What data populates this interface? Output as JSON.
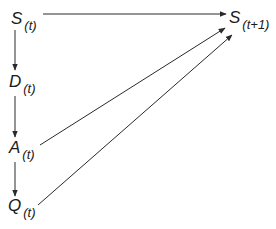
{
  "diagram": {
    "nodes": [
      {
        "id": "S_t",
        "label": "S",
        "subscript": "(t)"
      },
      {
        "id": "D_t",
        "label": "D",
        "subscript": "(t)"
      },
      {
        "id": "A_t",
        "label": "A",
        "subscript": "(t)"
      },
      {
        "id": "Q_t",
        "label": "Q",
        "subscript": "(t)"
      },
      {
        "id": "S_t1",
        "label": "S",
        "subscript": "(t+1)"
      }
    ],
    "edges": [
      {
        "from": "S_t",
        "to": "S_t1"
      },
      {
        "from": "S_t",
        "to": "D_t"
      },
      {
        "from": "D_t",
        "to": "A_t"
      },
      {
        "from": "A_t",
        "to": "Q_t"
      },
      {
        "from": "A_t",
        "to": "S_t1"
      },
      {
        "from": "Q_t",
        "to": "S_t1"
      }
    ],
    "line_color": "#2a2a2a"
  }
}
